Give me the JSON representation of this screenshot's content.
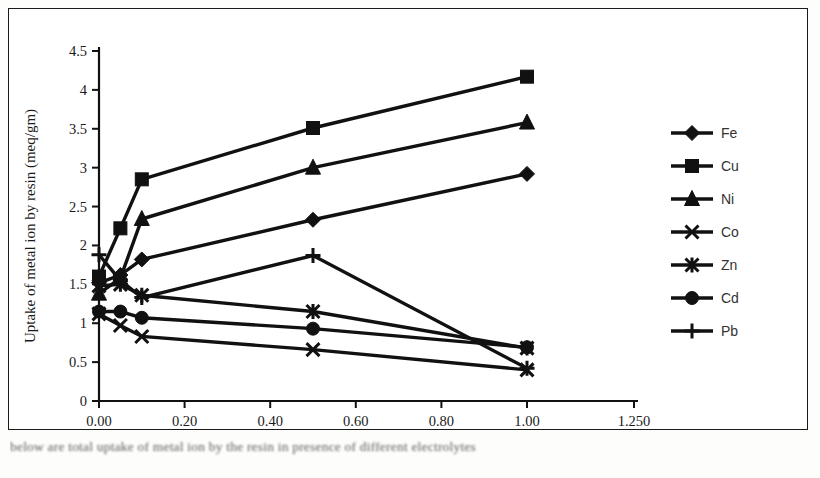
{
  "figure": {
    "caption": "below are total uptake of metal ion by the resin in presence of different electrolytes"
  },
  "chart_data": {
    "type": "line",
    "title": "",
    "xlabel": "Concentration of electrolyte solution (mol)",
    "ylabel": "Uptake of metal ion by resin (meq/gm)",
    "xlim": [
      0,
      1.25
    ],
    "ylim": [
      0,
      4.5
    ],
    "grid": false,
    "legend_position": "right",
    "xticks": [
      0,
      0.2,
      0.4,
      0.6,
      0.8,
      1.0,
      1.25
    ],
    "xtick_labels": [
      "0.00",
      "0.20",
      "0.40",
      "0.60",
      "0.80",
      "1.00",
      "1.250"
    ],
    "yticks": [
      0,
      0.5,
      1,
      1.5,
      2,
      2.5,
      3,
      3.5,
      4,
      4.5
    ],
    "ytick_labels": [
      "0",
      "0.5",
      "1",
      "1.5",
      "2",
      "2.5",
      "3",
      "3.5",
      "4",
      "4.5"
    ],
    "x": [
      0.0,
      0.05,
      0.1,
      0.5,
      1.0
    ],
    "series": [
      {
        "name": "Fe",
        "marker": "diamond",
        "values": [
          1.52,
          1.62,
          1.82,
          2.33,
          2.92
        ]
      },
      {
        "name": "Cu",
        "marker": "square",
        "values": [
          1.6,
          2.22,
          2.85,
          3.51,
          4.17
        ]
      },
      {
        "name": "Ni",
        "marker": "triangle",
        "values": [
          1.38,
          1.58,
          2.34,
          3.0,
          3.58
        ]
      },
      {
        "name": "Co",
        "marker": "cross",
        "values": [
          1.12,
          0.97,
          0.83,
          0.66,
          0.4
        ]
      },
      {
        "name": "Zn",
        "marker": "asterisk",
        "values": [
          1.48,
          1.5,
          1.36,
          1.15,
          0.68
        ]
      },
      {
        "name": "Cd",
        "marker": "circle",
        "values": [
          1.15,
          1.15,
          1.07,
          0.93,
          0.69
        ]
      },
      {
        "name": "Pb",
        "marker": "plus",
        "values": [
          1.88,
          1.55,
          1.33,
          1.87,
          0.42
        ]
      }
    ]
  },
  "legend": {
    "items": [
      {
        "label": "Fe",
        "marker": "diamond-marker-icon"
      },
      {
        "label": "Cu",
        "marker": "square-marker-icon"
      },
      {
        "label": "Ni",
        "marker": "triangle-marker-icon"
      },
      {
        "label": "Co",
        "marker": "cross-marker-icon"
      },
      {
        "label": "Zn",
        "marker": "asterisk-marker-icon"
      },
      {
        "label": "Cd",
        "marker": "circle-marker-icon"
      },
      {
        "label": "Pb",
        "marker": "plus-marker-icon"
      }
    ]
  }
}
